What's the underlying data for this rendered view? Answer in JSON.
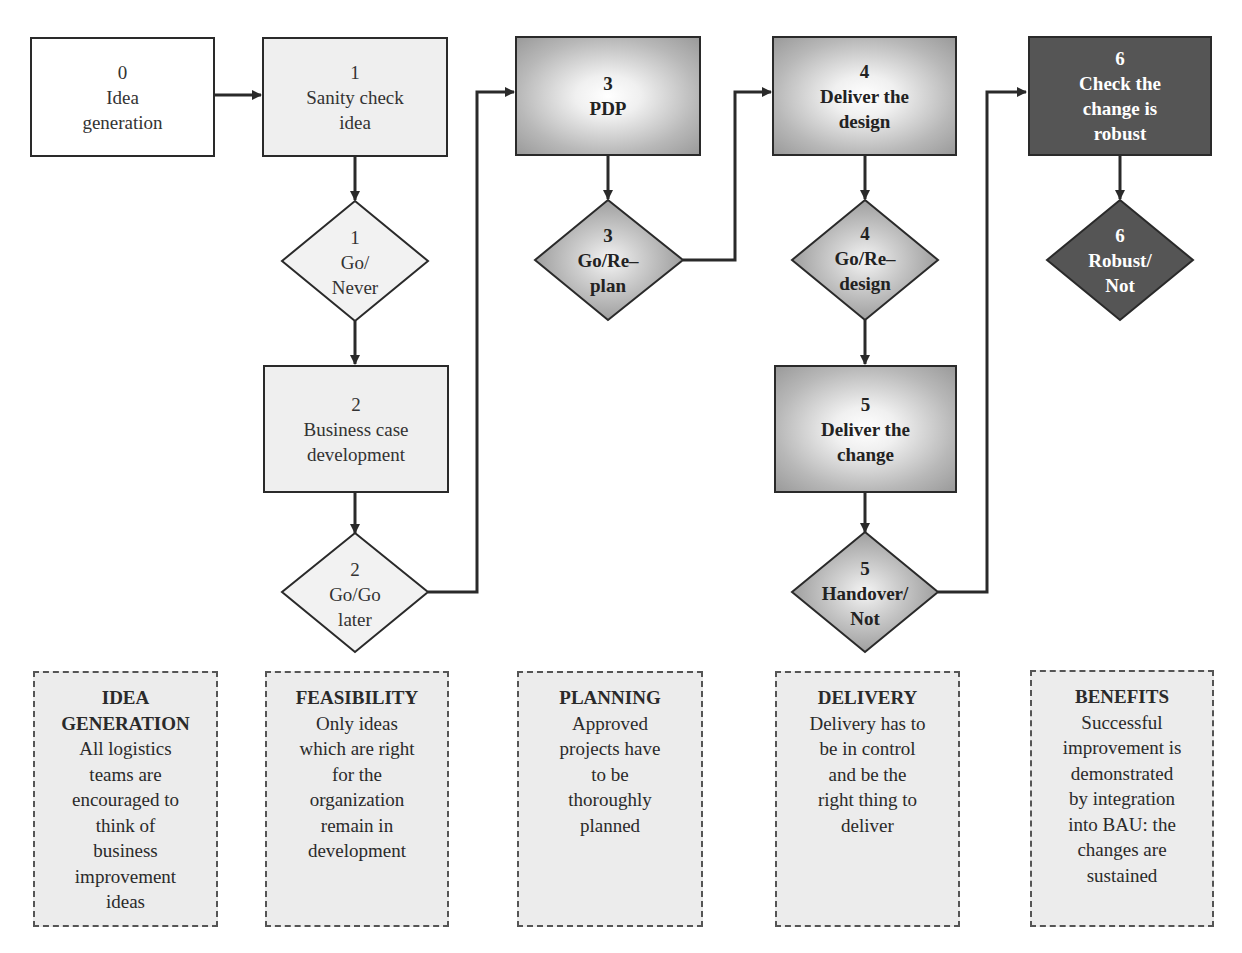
{
  "diagram": {
    "type": "process flowchart",
    "colors": {
      "line": "#2a2a2a",
      "light_fill": "#efefef",
      "gradient_fill_edge": "#9a9a9a",
      "dark_fill": "#555555",
      "note_fill": "#ececec"
    },
    "steps": [
      {
        "id": "step0",
        "number": "0",
        "lines": [
          "Idea",
          "generation"
        ],
        "style": "plain"
      },
      {
        "id": "step1",
        "number": "1",
        "lines": [
          "Sanity check",
          "idea"
        ],
        "style": "light"
      },
      {
        "id": "step2",
        "number": "2",
        "lines": [
          "Business case",
          "development"
        ],
        "style": "light"
      },
      {
        "id": "step3",
        "number": "3",
        "lines": [
          "PDP"
        ],
        "style": "gradient"
      },
      {
        "id": "step4",
        "number": "4",
        "lines": [
          "Deliver the",
          "design"
        ],
        "style": "gradient"
      },
      {
        "id": "step5",
        "number": "5",
        "lines": [
          "Deliver the",
          "change"
        ],
        "style": "gradient"
      },
      {
        "id": "step6",
        "number": "6",
        "lines": [
          "Check the",
          "change is",
          "robust"
        ],
        "style": "dark"
      }
    ],
    "decisions": [
      {
        "id": "gate1",
        "number": "1",
        "lines": [
          "Go/",
          "Never"
        ],
        "style": "light"
      },
      {
        "id": "gate2",
        "number": "2",
        "lines": [
          "Go/Go",
          "later"
        ],
        "style": "light"
      },
      {
        "id": "gate3",
        "number": "3",
        "lines": [
          "Go/Re–",
          "plan"
        ],
        "style": "gradient"
      },
      {
        "id": "gate4",
        "number": "4",
        "lines": [
          "Go/Re–",
          "design"
        ],
        "style": "gradient"
      },
      {
        "id": "gate5",
        "number": "5",
        "lines": [
          "Handover/",
          "Not"
        ],
        "style": "gradient"
      },
      {
        "id": "gate6",
        "number": "6",
        "lines": [
          "Robust/",
          "Not"
        ],
        "style": "dark"
      }
    ],
    "connections": [
      [
        "step0",
        "step1"
      ],
      [
        "step1",
        "gate1"
      ],
      [
        "gate1",
        "step2"
      ],
      [
        "step2",
        "gate2"
      ],
      [
        "gate2",
        "step3"
      ],
      [
        "step3",
        "gate3"
      ],
      [
        "gate3",
        "step4"
      ],
      [
        "step4",
        "gate4"
      ],
      [
        "gate4",
        "step5"
      ],
      [
        "step5",
        "gate5"
      ],
      [
        "gate5",
        "step6"
      ],
      [
        "step6",
        "gate6"
      ]
    ],
    "phases": [
      {
        "title": "IDEA GENERATION",
        "title_lines": [
          "IDEA",
          "GENERATION"
        ],
        "body_lines": [
          "All logistics",
          "teams are",
          "encouraged to",
          "think of",
          "business",
          "improvement",
          "ideas"
        ]
      },
      {
        "title": "FEASIBILITY",
        "title_lines": [
          "FEASIBILITY"
        ],
        "body_lines": [
          "Only ideas",
          "which are right",
          "for the",
          "organization",
          "remain in",
          "development"
        ]
      },
      {
        "title": "PLANNING",
        "title_lines": [
          "PLANNING"
        ],
        "body_lines": [
          "Approved",
          "projects have",
          "to be",
          "thoroughly",
          "planned"
        ]
      },
      {
        "title": "DELIVERY",
        "title_lines": [
          "DELIVERY"
        ],
        "body_lines": [
          "Delivery has to",
          "be in control",
          "and be the",
          "right thing to",
          "deliver"
        ]
      },
      {
        "title": "BENEFITS",
        "title_lines": [
          "BENEFITS"
        ],
        "body_lines": [
          "Successful",
          "improvement is",
          "demonstrated",
          "by integration",
          "into BAU: the",
          "changes are",
          "sustained"
        ]
      }
    ]
  }
}
